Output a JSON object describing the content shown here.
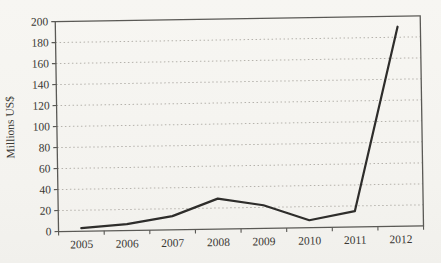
{
  "chart_data": {
    "type": "line",
    "title": "",
    "xlabel": "",
    "ylabel": "Millions US$",
    "categories": [
      "2005",
      "2006",
      "2007",
      "2008",
      "2009",
      "2010",
      "2011",
      "2012"
    ],
    "values": [
      3,
      6,
      13,
      29,
      22,
      7,
      15,
      190
    ],
    "ylim": [
      0,
      200
    ],
    "ytick_step": 20,
    "yticks": [
      0,
      20,
      40,
      60,
      80,
      100,
      120,
      140,
      160,
      180,
      200
    ],
    "grid": "horizontal-dotted",
    "legend": "none",
    "colors": {
      "line": "#2e2d2b",
      "axis": "#5a5955",
      "gridline": "#b5b2ac",
      "text": "#3a3834",
      "page_background": "#f6f5f1"
    }
  }
}
